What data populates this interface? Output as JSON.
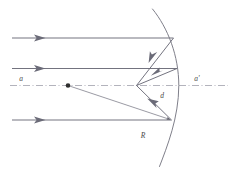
{
  "figure": {
    "type": "optics-ray-diagram",
    "background_color": "#ffffff",
    "ray_color": "#6b6b78",
    "mirror_color": "#7a7a85",
    "axis_color": "#9a9aa5",
    "label_color": "#4a4a4a",
    "width": 234,
    "height": 173
  },
  "labels": {
    "axis_left": "a",
    "axis_right": "a'",
    "distance": "d",
    "radius": "R"
  },
  "elements": {
    "optical_axis_name": "optical-axis",
    "mirror_name": "concave-mirror-arc",
    "center_of_curvature_name": "center-of-curvature-point"
  },
  "geometry": {
    "center_of_curvature": {
      "x": 68,
      "y": 85.5
    },
    "focus_paraxial": {
      "x": 137,
      "y": 85.5
    },
    "mirror_vertex": {
      "x": 178.5,
      "y": 85.5
    },
    "axis_y": 85.5,
    "incident_rays": [
      {
        "name": "incident-ray-top",
        "y": 38.0,
        "x_start": 12,
        "x_end": 173.0
      },
      {
        "name": "incident-ray-middle",
        "y": 68.5,
        "x_start": 12,
        "x_end": 176.5
      },
      {
        "name": "incident-ray-bottom",
        "y": 120.0,
        "x_start": 12,
        "x_end": 171.0
      }
    ],
    "reflected_rays": [
      {
        "name": "reflected-ray-top",
        "from_x": 173.0,
        "from_y": 38.0,
        "to_x": 136.5,
        "to_y": 85.5
      },
      {
        "name": "reflected-ray-middle",
        "from_x": 176.5,
        "from_y": 68.5,
        "to_x": 136.5,
        "to_y": 85.5
      },
      {
        "name": "reflected-ray-bottom",
        "from_x": 171.0,
        "from_y": 120.0,
        "to_x": 136.5,
        "to_y": 85.5
      }
    ],
    "radius_line": {
      "from_x": 68,
      "from_y": 85.5,
      "to_x": 171.0,
      "to_y": 120.0
    },
    "mirror_arc": {
      "start_x": 152.0,
      "start_y": 10.0,
      "end_x": 160.0,
      "end_y": 165.0,
      "radius": 112,
      "vertex_x": 180.0
    }
  },
  "label_positions": {
    "axis_left": {
      "x": 21,
      "y": 81
    },
    "axis_right": {
      "x": 196,
      "y": 81
    },
    "distance": {
      "x": 162,
      "y": 97
    },
    "radius": {
      "x": 143,
      "y": 137
    }
  }
}
